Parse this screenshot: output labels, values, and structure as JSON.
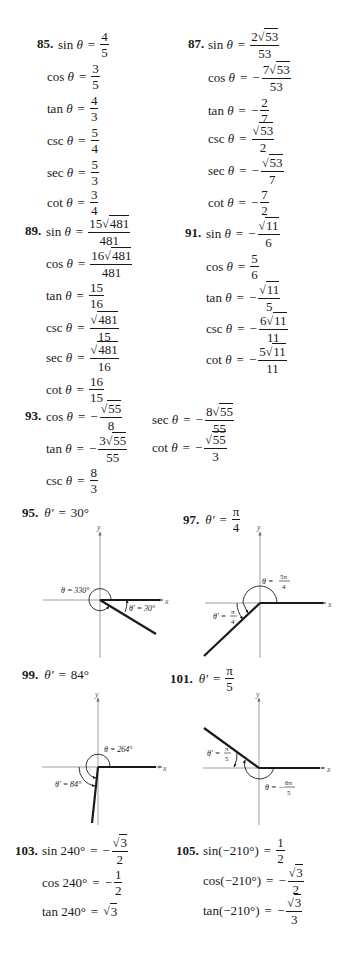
{
  "problems": {
    "p85": {
      "number": "85.",
      "rows": [
        {
          "fn": "sin θ",
          "sign": "",
          "num": "4",
          "den": "5"
        },
        {
          "fn": "cos θ",
          "sign": "",
          "num": "3",
          "den": "5"
        },
        {
          "fn": "tan θ",
          "sign": "",
          "num": "4",
          "den": "3"
        },
        {
          "fn": "csc θ",
          "sign": "",
          "num": "5",
          "den": "4"
        },
        {
          "fn": "sec θ",
          "sign": "",
          "num": "5",
          "den": "3"
        },
        {
          "fn": "cot θ",
          "sign": "",
          "num": "3",
          "den": "4"
        }
      ]
    },
    "p87": {
      "number": "87.",
      "rows": [
        {
          "fn": "sin θ",
          "sign": "",
          "coef": "2",
          "rad": "53",
          "den": "53"
        },
        {
          "fn": "cos θ",
          "sign": "−",
          "coef": "7",
          "rad": "53",
          "den": "53"
        },
        {
          "fn": "tan θ",
          "sign": "−",
          "coef": "2",
          "rad": "",
          "den": "7"
        },
        {
          "fn": "csc θ",
          "sign": "",
          "coef": "",
          "rad": "53",
          "den": "2"
        },
        {
          "fn": "sec θ",
          "sign": "−",
          "coef": "",
          "rad": "53",
          "den": "7"
        },
        {
          "fn": "cot θ",
          "sign": "−",
          "coef": "7",
          "rad": "",
          "den": "2"
        }
      ]
    },
    "p89": {
      "number": "89.",
      "rows": [
        {
          "fn": "sin θ",
          "sign": "",
          "coef": "15",
          "rad": "481",
          "den": "481"
        },
        {
          "fn": "cos θ",
          "sign": "",
          "coef": "16",
          "rad": "481",
          "den": "481"
        },
        {
          "fn": "tan θ",
          "sign": "",
          "coef": "15",
          "rad": "",
          "den": "16"
        },
        {
          "fn": "csc θ",
          "sign": "",
          "coef": "",
          "rad": "481",
          "den": "15"
        },
        {
          "fn": "sec θ",
          "sign": "",
          "coef": "",
          "rad": "481",
          "den": "16"
        },
        {
          "fn": "cot θ",
          "sign": "",
          "coef": "16",
          "rad": "",
          "den": "15"
        }
      ]
    },
    "p91": {
      "number": "91.",
      "rows": [
        {
          "fn": "sin θ",
          "sign": "−",
          "coef": "",
          "rad": "11",
          "den": "6"
        },
        {
          "fn": "cos θ",
          "sign": "",
          "coef": "5",
          "rad": "",
          "den": "6"
        },
        {
          "fn": "tan θ",
          "sign": "−",
          "coef": "",
          "rad": "11",
          "den": "5"
        },
        {
          "fn": "csc θ",
          "sign": "−",
          "coef": "6",
          "rad": "11",
          "den": "11"
        },
        {
          "fn": "cot θ",
          "sign": "−",
          "coef": "5",
          "rad": "11",
          "den": "11"
        }
      ]
    },
    "p93": {
      "number": "93.",
      "rows": [
        {
          "fn": "cos θ",
          "sign": "−",
          "coef": "",
          "rad": "55",
          "den": "8"
        },
        {
          "fn": "tan θ",
          "sign": "−",
          "coef": "3",
          "rad": "55",
          "den": "55"
        },
        {
          "fn": "csc θ",
          "sign": "",
          "coef": "8",
          "rad": "",
          "den": "3"
        },
        {
          "fn": "sec θ",
          "sign": "−",
          "coef": "8",
          "rad": "55",
          "den": "55"
        },
        {
          "fn": "cot θ",
          "sign": "−",
          "coef": "",
          "rad": "55",
          "den": "3"
        }
      ]
    },
    "p95": {
      "number": "95.",
      "answer_lhs": "θ′",
      "answer": "30°",
      "theta_label": "θ = 330°",
      "ref_label": "θ′ = 30°"
    },
    "p97": {
      "number": "97.",
      "answer_lhs": "θ′",
      "answer_num": "π",
      "answer_den": "4",
      "theta_label": "θ =",
      "theta_num": "5π",
      "theta_den": "4",
      "ref_label": "θ′ =",
      "ref_num": "π",
      "ref_den": "4"
    },
    "p99": {
      "number": "99.",
      "answer_lhs": "θ′",
      "answer": "84°",
      "theta_label": "θ = 264°",
      "ref_label": "θ′ = 84°"
    },
    "p101": {
      "number": "101.",
      "answer_lhs": "θ′",
      "answer_num": "π",
      "answer_den": "5",
      "theta_label": "θ = −",
      "theta_num": "6π",
      "theta_den": "5",
      "ref_label": "θ′ =",
      "ref_num": "π",
      "ref_den": "5"
    },
    "p103": {
      "number": "103.",
      "rows": [
        {
          "fn": "sin 240°",
          "sign": "−",
          "rad": "3",
          "den": "2"
        },
        {
          "fn": "cos 240°",
          "sign": "−",
          "num": "1",
          "den": "2"
        },
        {
          "fn": "tan 240°",
          "sign": "",
          "rad": "3"
        }
      ]
    },
    "p105": {
      "number": "105.",
      "rows": [
        {
          "fn": "sin(−210°)",
          "sign": "",
          "num": "1",
          "den": "2"
        },
        {
          "fn": "cos(−210°)",
          "sign": "−",
          "rad": "3",
          "den": "2"
        },
        {
          "fn": "tan(−210°)",
          "sign": "−",
          "rad": "3",
          "den": "3"
        }
      ]
    }
  },
  "axis_labels": {
    "x": "x",
    "y": "y"
  },
  "symbols": {
    "eq": "=",
    "sqrt": "√"
  }
}
